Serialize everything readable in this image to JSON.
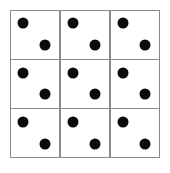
{
  "figure": {
    "background_color": "#ffffff",
    "grid_line_color": "#8a8a8a",
    "pip_color": "#0a0a0a",
    "rows": 3,
    "columns": 3,
    "cells": [
      {
        "row": 1,
        "column": 1,
        "pip_count": "2",
        "pips": [
          {
            "name": "upper-left",
            "position": "upper-left"
          },
          {
            "name": "lower-right",
            "position": "lower-right"
          }
        ]
      },
      {
        "row": 1,
        "column": 2,
        "pip_count": "2",
        "pips": [
          {
            "name": "upper-left",
            "position": "upper-left"
          },
          {
            "name": "lower-right",
            "position": "lower-right"
          }
        ]
      },
      {
        "row": 1,
        "column": 3,
        "pip_count": "2",
        "pips": [
          {
            "name": "upper-left",
            "position": "upper-left"
          },
          {
            "name": "lower-right",
            "position": "lower-right"
          }
        ]
      },
      {
        "row": 2,
        "column": 1,
        "pip_count": "2",
        "pips": [
          {
            "name": "upper-left",
            "position": "upper-left"
          },
          {
            "name": "lower-right",
            "position": "lower-right"
          }
        ]
      },
      {
        "row": 2,
        "column": 2,
        "pip_count": "2",
        "pips": [
          {
            "name": "upper-left",
            "position": "upper-left"
          },
          {
            "name": "lower-right",
            "position": "lower-right"
          }
        ]
      },
      {
        "row": 2,
        "column": 3,
        "pip_count": "2",
        "pips": [
          {
            "name": "upper-left",
            "position": "upper-left"
          },
          {
            "name": "lower-right",
            "position": "lower-right"
          }
        ]
      },
      {
        "row": 3,
        "column": 1,
        "pip_count": "2",
        "pips": [
          {
            "name": "upper-left",
            "position": "upper-left"
          },
          {
            "name": "lower-right",
            "position": "lower-right"
          }
        ]
      },
      {
        "row": 3,
        "column": 2,
        "pip_count": "2",
        "pips": [
          {
            "name": "upper-left",
            "position": "upper-left"
          },
          {
            "name": "lower-right",
            "position": "lower-right"
          }
        ]
      },
      {
        "row": 3,
        "column": 3,
        "pip_count": "2",
        "pips": [
          {
            "name": "upper-left",
            "position": "upper-left"
          },
          {
            "name": "lower-right",
            "position": "lower-right"
          }
        ]
      }
    ]
  }
}
